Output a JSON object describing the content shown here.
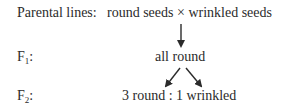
{
  "diagram": {
    "rows": [
      {
        "label": "Parental lines:",
        "content": "round seeds × wrinkled seeds"
      },
      {
        "label_main": "F",
        "label_sub": "1",
        "label_suffix": ":",
        "content": "all round"
      },
      {
        "label_main": "F",
        "label_sub": "2",
        "label_suffix": ":",
        "content": "3 round : 1 wrinkled"
      }
    ],
    "arrows": [
      {
        "from": "parental",
        "to": "F1",
        "direction": "down"
      },
      {
        "from": "F1",
        "to": "F2",
        "direction": "down-left"
      },
      {
        "from": "F1",
        "to": "F2",
        "direction": "down-right"
      }
    ],
    "colors": {
      "text": "#2b2b2b",
      "arrow": "#2b2b2b",
      "background": "#ffffff"
    }
  }
}
